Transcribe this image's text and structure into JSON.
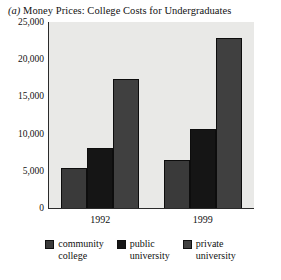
{
  "figure": {
    "marker": "(a)",
    "title": "Money Prices: College Costs for Undergraduates"
  },
  "chart_data": {
    "type": "bar",
    "title": "(a) Money Prices: College Costs for Undergraduates",
    "xlabel": "",
    "ylabel": "",
    "categories": [
      "1992",
      "1999"
    ],
    "series": [
      {
        "name": "community college",
        "values": [
          5400,
          6400
        ],
        "color": "#3a3a3a"
      },
      {
        "name": "public university",
        "values": [
          8100,
          10600
        ],
        "color": "#151515"
      },
      {
        "name": "private university",
        "values": [
          17300,
          22800
        ],
        "color": "#404040"
      }
    ],
    "ylim": [
      0,
      25000
    ],
    "yticks": [
      0,
      5000,
      10000,
      15000,
      20000,
      25000
    ],
    "ytick_labels": [
      "0",
      "5,000",
      "10,000",
      "15,000",
      "20,000",
      "25,000"
    ],
    "grid": false,
    "legend_position": "bottom",
    "plot_background": "#e9e9e7"
  },
  "axis": {
    "ticks": [
      {
        "label": "25,000",
        "value": 25000
      },
      {
        "label": "20,000",
        "value": 20000
      },
      {
        "label": "15,000",
        "value": 15000
      },
      {
        "label": "10,000",
        "value": 10000
      },
      {
        "label": "5,000",
        "value": 5000
      },
      {
        "label": "0",
        "value": 0
      }
    ]
  },
  "groups": [
    {
      "label": "1992"
    },
    {
      "label": "1999"
    }
  ],
  "legend": [
    {
      "line1": "community",
      "line2": "college"
    },
    {
      "line1": "public",
      "line2": "university"
    },
    {
      "line1": "private",
      "line2": "university"
    }
  ]
}
